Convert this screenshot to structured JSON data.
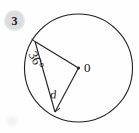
{
  "problem": {
    "number": "3"
  },
  "figure": {
    "type": "circle-geometry-diagram",
    "center_label": "0",
    "angle_label": "36°",
    "side_label": "d",
    "stroke_color": "#1a1a1a",
    "background_color": "#fefefe",
    "badge_color": "#dcdcdc",
    "circle": {
      "cx": 78.5,
      "cy": 68,
      "r": 54
    },
    "points": {
      "center": {
        "x": 78.5,
        "y": 68,
        "name": "0"
      },
      "upper_vertex": {
        "x": 35,
        "y": 41.5
      },
      "lower_vertex": {
        "x": 55,
        "y": 112
      }
    },
    "segments": [
      {
        "name": "radius-to-upper-vertex",
        "from": "center",
        "to": "upper_vertex"
      },
      {
        "name": "radius-to-lower-vertex",
        "from": "center",
        "to": "lower_vertex"
      },
      {
        "name": "chord-d",
        "from": "upper_vertex",
        "to": "lower_vertex",
        "label": "d"
      }
    ],
    "angles": [
      {
        "name": "inscribed-angle",
        "at": "upper_vertex",
        "value": "36°"
      }
    ]
  }
}
